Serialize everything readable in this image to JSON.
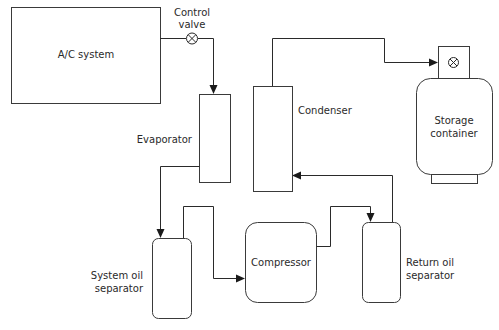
{
  "diagram": {
    "type": "refrigerant recovery flow diagram",
    "nodes": {
      "ac_system": {
        "label": "A/C system"
      },
      "control_valve": {
        "label_line1": "Control",
        "label_line2": "valve"
      },
      "evaporator": {
        "label": "Evaporator"
      },
      "condenser": {
        "label": "Condenser"
      },
      "storage_container": {
        "label_line1": "Storage",
        "label_line2": "container"
      },
      "system_oil_separator": {
        "label_line1": "System oil",
        "label_line2": "separator"
      },
      "compressor": {
        "label": "Compressor"
      },
      "return_oil_separator": {
        "label_line1": "Return oil",
        "label_line2": "separator"
      }
    },
    "flows": [
      {
        "from": "A/C system",
        "via": "Control valve",
        "to": "Evaporator"
      },
      {
        "from": "Evaporator",
        "to": "System oil separator"
      },
      {
        "from": "System oil separator",
        "to": "Compressor"
      },
      {
        "from": "Compressor",
        "to": "Return oil separator"
      },
      {
        "from": "Return oil separator",
        "to": "Condenser"
      },
      {
        "from": "Condenser",
        "to": "Storage container"
      }
    ]
  }
}
